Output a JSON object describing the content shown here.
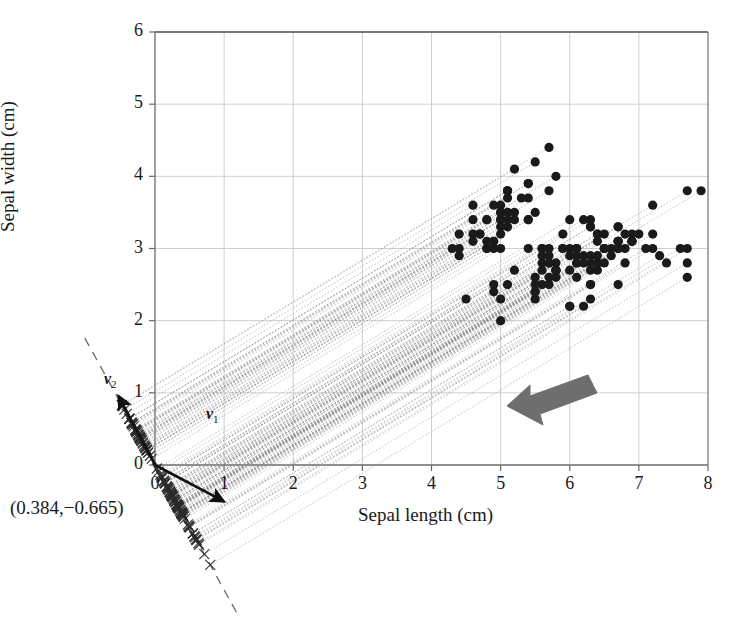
{
  "figure": {
    "title": "",
    "background": "#ffffff",
    "width": 741,
    "height": 618
  },
  "axes": {
    "x_title": "Sepal length (cm)",
    "y_title": "Sepal width (cm)",
    "x_ticks": [
      "0",
      "1",
      "2",
      "3",
      "4",
      "5",
      "6",
      "7",
      "8"
    ],
    "y_ticks": [
      "0",
      "1",
      "2",
      "3",
      "4",
      "5",
      "6"
    ]
  },
  "annotations": {
    "coordinate_label": "(0.384,−0.665)",
    "vector1_label": "v",
    "vector1_sub": "1",
    "vector2_label": "v",
    "vector2_sub": "2",
    "arrow_name": "projection-direction-arrow"
  },
  "colors": {
    "point": "#1a1a1a",
    "gridline": "#c9c9c9",
    "axis": "#6b6b6b",
    "projection_line": "#8c8c8c",
    "dashed_axis": "#707070",
    "big_arrow": "#6e6e6e",
    "marker_x": "#2b2b2b",
    "text": "#1a1a1a"
  },
  "chart_data": {
    "type": "scatter",
    "title": "",
    "xlabel": "Sepal length (cm)",
    "ylabel": "Sepal width (cm)",
    "xlim": [
      0,
      8
    ],
    "ylim": [
      0,
      6
    ],
    "xticks": [
      0,
      1,
      2,
      3,
      4,
      5,
      6,
      7,
      8
    ],
    "yticks": [
      0,
      1,
      2,
      3,
      4,
      5,
      6
    ],
    "grid": true,
    "legend": null,
    "marker": "filled-circle",
    "marker_color": "#1a1a1a",
    "principal_direction": [
      0.384,
      -0.665
    ],
    "principal_direction_label": "(0.384,−0.665)",
    "eigenvector_arrows": [
      {
        "name": "v1",
        "label": "v",
        "subscript": "1",
        "direction": [
          0.884,
          -0.467
        ],
        "drawn_from_origin": true
      },
      {
        "name": "v2",
        "label": "v",
        "subscript": "2",
        "direction": [
          -0.467,
          0.884
        ],
        "drawn_from_origin": true
      }
    ],
    "projection_lines": "dotted lines from each data point to its projection on the principal axis through the origin",
    "projected_marker": "x",
    "annotations": [
      {
        "type": "arrow",
        "text": "",
        "direction": "down-left",
        "meaning": "projection direction"
      }
    ],
    "series": [
      {
        "name": "Iris sepal measurements",
        "x": [
          5.1,
          4.9,
          4.7,
          4.6,
          5.0,
          5.4,
          4.6,
          5.0,
          4.4,
          4.9,
          5.4,
          4.8,
          4.8,
          4.3,
          5.8,
          5.7,
          5.4,
          5.1,
          5.7,
          5.1,
          5.4,
          5.1,
          4.6,
          5.1,
          4.8,
          5.0,
          5.0,
          5.2,
          5.2,
          4.7,
          4.8,
          5.4,
          5.2,
          5.5,
          4.9,
          5.0,
          5.5,
          4.9,
          4.4,
          5.1,
          5.0,
          4.5,
          4.4,
          5.0,
          5.1,
          4.8,
          5.1,
          4.6,
          5.3,
          5.0,
          7.0,
          6.4,
          6.9,
          5.5,
          6.5,
          5.7,
          6.3,
          4.9,
          6.6,
          5.2,
          5.0,
          5.9,
          6.0,
          6.1,
          5.6,
          6.7,
          5.6,
          5.8,
          6.2,
          5.6,
          5.9,
          6.1,
          6.3,
          6.1,
          6.4,
          6.6,
          6.8,
          6.7,
          6.0,
          5.7,
          5.5,
          5.5,
          5.8,
          6.0,
          5.4,
          6.0,
          6.7,
          6.3,
          5.6,
          5.5,
          5.5,
          6.1,
          5.8,
          5.0,
          5.6,
          5.7,
          5.7,
          6.2,
          5.1,
          5.7,
          6.3,
          5.8,
          7.1,
          6.3,
          6.5,
          7.6,
          4.9,
          7.3,
          6.7,
          7.2,
          6.5,
          6.4,
          6.8,
          5.7,
          5.8,
          6.4,
          6.5,
          7.7,
          7.7,
          6.0,
          6.9,
          5.6,
          7.7,
          6.3,
          6.7,
          7.2,
          6.2,
          6.1,
          6.4,
          7.2,
          7.4,
          7.9,
          6.4,
          6.3,
          6.1,
          7.7,
          6.3,
          6.4,
          6.0,
          6.9,
          6.7,
          6.9,
          5.8,
          6.8,
          6.7,
          6.7,
          6.3,
          6.5,
          6.2,
          5.9
        ],
        "y": [
          3.5,
          3.0,
          3.2,
          3.1,
          3.6,
          3.9,
          3.4,
          3.4,
          2.9,
          3.1,
          3.7,
          3.4,
          3.0,
          3.0,
          4.0,
          4.4,
          3.9,
          3.5,
          3.8,
          3.8,
          3.4,
          3.7,
          3.6,
          3.3,
          3.4,
          3.0,
          3.4,
          3.5,
          3.4,
          3.2,
          3.1,
          3.4,
          4.1,
          4.2,
          3.1,
          3.2,
          3.5,
          3.6,
          3.0,
          3.4,
          3.5,
          2.3,
          3.2,
          3.5,
          3.8,
          3.0,
          3.8,
          3.2,
          3.7,
          3.3,
          3.2,
          3.2,
          3.1,
          2.3,
          2.8,
          2.8,
          3.3,
          2.4,
          2.9,
          2.7,
          2.0,
          3.0,
          2.2,
          2.9,
          2.9,
          3.1,
          3.0,
          2.7,
          2.2,
          2.5,
          3.2,
          2.8,
          2.5,
          2.8,
          2.9,
          3.0,
          2.8,
          3.0,
          2.9,
          2.6,
          2.4,
          2.4,
          2.7,
          2.7,
          3.0,
          3.4,
          3.1,
          2.3,
          3.0,
          2.5,
          2.6,
          3.0,
          2.6,
          2.3,
          2.7,
          3.0,
          2.9,
          2.9,
          2.5,
          2.8,
          3.3,
          2.7,
          3.0,
          2.9,
          3.0,
          3.0,
          2.5,
          2.9,
          2.5,
          3.6,
          3.2,
          2.7,
          3.0,
          2.5,
          2.8,
          3.2,
          3.0,
          3.8,
          2.6,
          2.2,
          3.2,
          2.8,
          2.8,
          2.7,
          3.3,
          3.2,
          2.8,
          3.0,
          2.8,
          3.0,
          2.8,
          3.8,
          2.8,
          2.8,
          2.6,
          3.0,
          3.4,
          3.1,
          3.0,
          3.1,
          3.1,
          3.1,
          2.7,
          3.2,
          3.3,
          3.0,
          2.5,
          3.0,
          3.4,
          3.0
        ]
      }
    ]
  }
}
